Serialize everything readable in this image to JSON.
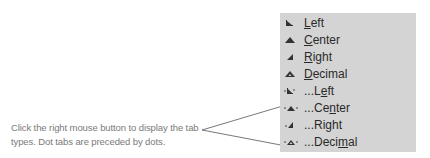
{
  "callout": {
    "text": "Click the right mouse button to display the tab types.  Dot tabs are preceded by dots."
  },
  "menu": {
    "items": [
      {
        "label": "Left",
        "mnemonic": "L",
        "icon": "left-tab-icon"
      },
      {
        "label": "Center",
        "mnemonic": "C",
        "icon": "center-tab-icon"
      },
      {
        "label": "Right",
        "mnemonic": "R",
        "icon": "right-tab-icon"
      },
      {
        "label": "Decimal",
        "mnemonic": "D",
        "icon": "decimal-tab-icon"
      },
      {
        "label": "...Left",
        "mnemonic": "e",
        "icon": "dot-left-tab-icon"
      },
      {
        "label": "...Center",
        "mnemonic": "n",
        "icon": "dot-center-tab-icon"
      },
      {
        "label": "...Right",
        "mnemonic": "g",
        "icon": "dot-right-tab-icon"
      },
      {
        "label": "...Decimal",
        "mnemonic": "m",
        "icon": "dot-decimal-tab-icon"
      }
    ]
  },
  "colors": {
    "menu_bg": "#d4d4d4",
    "callout_text": "#7a7a7a",
    "menu_text": "#2a2a2a",
    "leader_line": "#555555"
  }
}
